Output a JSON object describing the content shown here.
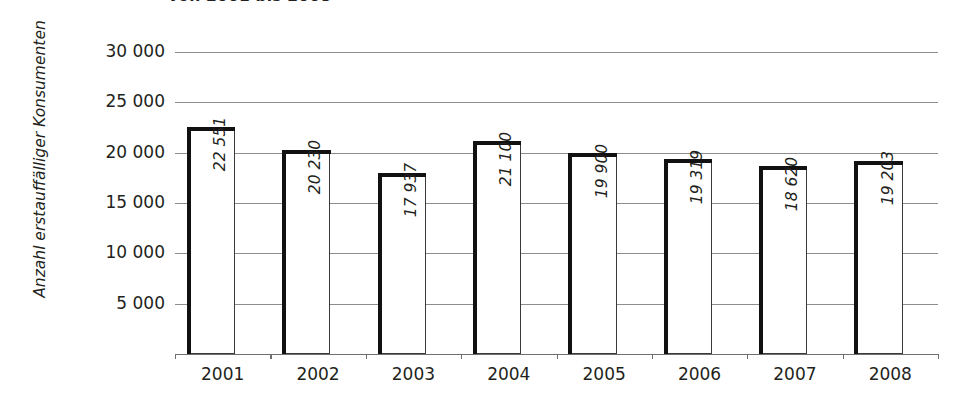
{
  "chart_data": {
    "type": "bar",
    "title": "von 2001 bis 2008",
    "xlabel": "",
    "ylabel": "Anzahl erstauffälliger Konsumenten",
    "categories": [
      "2001",
      "2002",
      "2003",
      "2004",
      "2005",
      "2006",
      "2007",
      "2008"
    ],
    "values": [
      22551,
      20230,
      17937,
      21100,
      19900,
      19319,
      18620,
      19203
    ],
    "value_labels": [
      "22 551",
      "20 230",
      "17 937",
      "21 100",
      "19 900",
      "19 319",
      "18 620",
      "19 203"
    ],
    "ylim": [
      0,
      30000
    ],
    "ytick_values": [
      30000,
      25000,
      20000,
      15000,
      10000,
      5000
    ],
    "ytick_labels": [
      "30 000",
      "25 000",
      "20 000",
      "15 000",
      "10 000",
      "5 000"
    ],
    "grid": true,
    "legend": null,
    "colors": {
      "bar_fill": "#ffffff",
      "bar_outline": "#3a3a3a",
      "bar_shadow": "#111111",
      "gridline": "#8d8d8d",
      "axis": "#6f6f6f",
      "text": "#231f20"
    }
  }
}
